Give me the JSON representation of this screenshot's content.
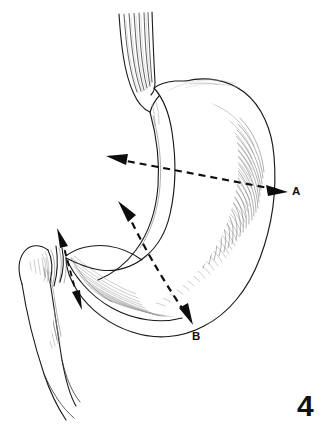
{
  "figure": {
    "number": "4",
    "domain": "medical-illustration",
    "background_color": "#ffffff",
    "ink_color": "#1a1a1a",
    "shading_color": "#9a9a9a"
  },
  "labels": {
    "a": "A",
    "b": "B"
  },
  "annotations": [
    {
      "id": "a",
      "label": "A",
      "style": "dashed-double-arrow",
      "orientation": "horizontal",
      "start": [
        110,
        157
      ],
      "end": [
        283,
        190
      ],
      "label_position": [
        292,
        186
      ]
    },
    {
      "id": "b",
      "label": "B",
      "style": "dashed-double-arrow-curved",
      "orientation": "oblique",
      "start": [
        122,
        205
      ],
      "end": [
        190,
        320
      ],
      "label_position": [
        192,
        331
      ]
    },
    {
      "id": "pylorus",
      "label": "",
      "style": "dashed-double-arrow",
      "orientation": "oblique-short",
      "start": [
        58,
        232
      ],
      "end": [
        80,
        307
      ],
      "label_position": null
    }
  ],
  "anatomy": {
    "parts": [
      "esophagus",
      "cardia",
      "fundus",
      "body",
      "greater-curvature",
      "lesser-curvature",
      "antrum",
      "pylorus",
      "duodenum"
    ]
  }
}
